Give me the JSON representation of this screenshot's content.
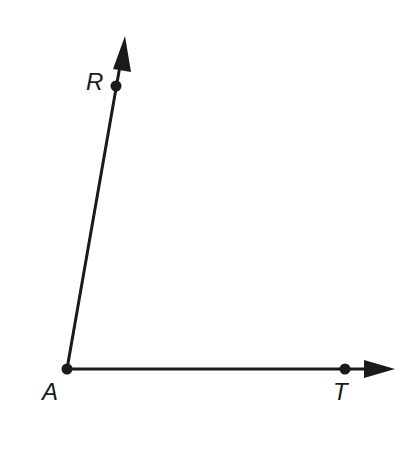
{
  "diagram": {
    "type": "angle",
    "colors": {
      "stroke": "#1a1a1a",
      "background": "#ffffff"
    },
    "points": {
      "A": {
        "label": "A",
        "x": 67,
        "y": 369
      },
      "R": {
        "label": "R",
        "x": 116,
        "y": 86
      },
      "T": {
        "label": "T",
        "x": 345,
        "y": 369
      }
    },
    "rays": [
      {
        "name": "ray-AR",
        "from": "A",
        "through": "R",
        "arrow_tip": {
          "x": 125,
          "y": 36
        }
      },
      {
        "name": "ray-AT",
        "from": "A",
        "through": "T",
        "arrow_tip": {
          "x": 395,
          "y": 369
        }
      }
    ],
    "labels": {
      "R": "R",
      "A": "A",
      "T": "T"
    }
  }
}
